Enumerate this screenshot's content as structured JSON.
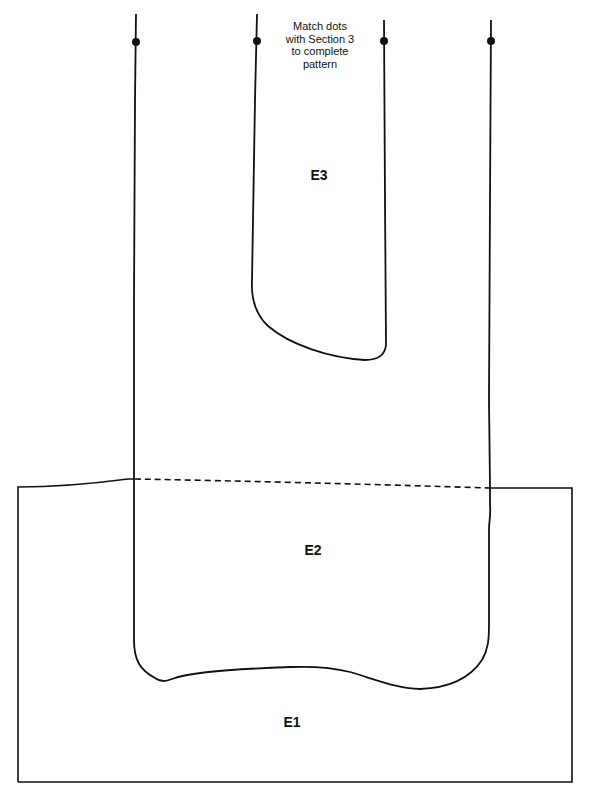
{
  "diagram": {
    "type": "sewing-pattern-piece",
    "note": {
      "lines": [
        "Match dots",
        "with Section 3",
        "to complete",
        "pattern"
      ]
    },
    "labels": {
      "e3": "E3",
      "e2": "E2",
      "e1": "E1"
    },
    "colors": {
      "stroke": "#111111",
      "background": "#ffffff"
    },
    "match_dots": 4
  }
}
